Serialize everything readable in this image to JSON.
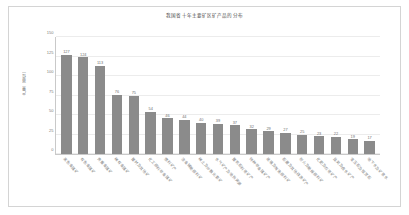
{
  "chart_data": {
    "type": "bar",
    "title": "我国省十年主要矿区矿产品的分布",
    "xlabel": "",
    "ylabel": "产量（单位）",
    "ylim": [
      0,
      150
    ],
    "yticks": [
      0,
      25,
      50,
      75,
      100,
      125,
      150
    ],
    "grid": true,
    "legend": "none",
    "bar_color": "#8b8b8b",
    "categories": [
      "黑色金属矿",
      "有色金属矿",
      "贵重金属矿",
      "稀有金属矿",
      "建材及其他矿",
      "化工原料非金属矿",
      "燃料矿产",
      "冶金辅助原料矿",
      "稀土及分散元素矿",
      "水气矿产及地热资源",
      "建筑石料用矿产",
      "特种非金属矿产",
      "玻璃及陶瓷原料矿",
      "石墨及其他碳质矿产",
      "耐火及助熔原料矿",
      "化肥及农用矿产",
      "盐类及卤水矿产",
      "宝玉石及观赏石",
      "地下水及矿泉水"
    ],
    "values": [
      127,
      124,
      113,
      76,
      75,
      54,
      46,
      44,
      40,
      39,
      37,
      32,
      29,
      27,
      25,
      23,
      22,
      19,
      17
    ]
  }
}
